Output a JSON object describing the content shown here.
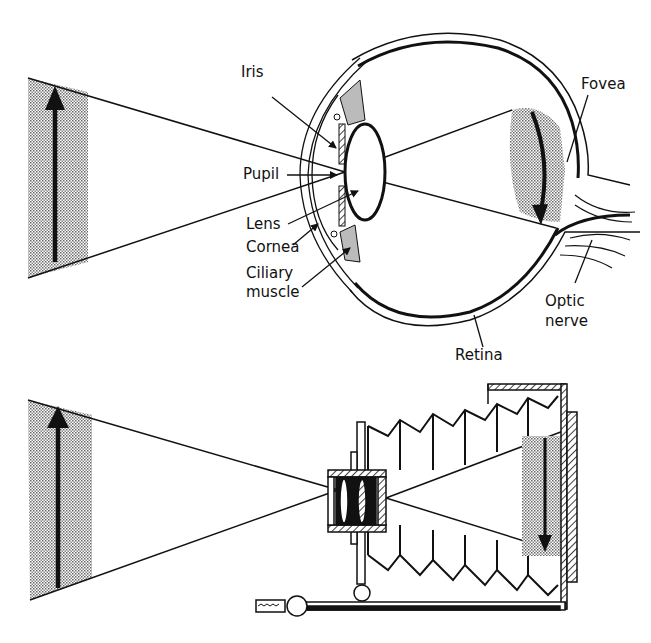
{
  "figure": {
    "eye": {
      "labels": {
        "iris": "Iris",
        "pupil": "Pupil",
        "lens": "Lens",
        "cornea": "Cornea",
        "ciliary_muscle_line1": "Ciliary",
        "ciliary_muscle_line2": "muscle",
        "fovea": "Fovea",
        "optic_nerve_line1": "Optic",
        "optic_nerve_line2": "nerve",
        "retina": "Retina"
      }
    },
    "camera": {
      "parts": [
        "lens",
        "bellows",
        "film-back",
        "rail",
        "shutter-release"
      ]
    },
    "colors": {
      "ink": "#111111",
      "stipple": "#9a9a9a",
      "background": "#ffffff"
    }
  }
}
